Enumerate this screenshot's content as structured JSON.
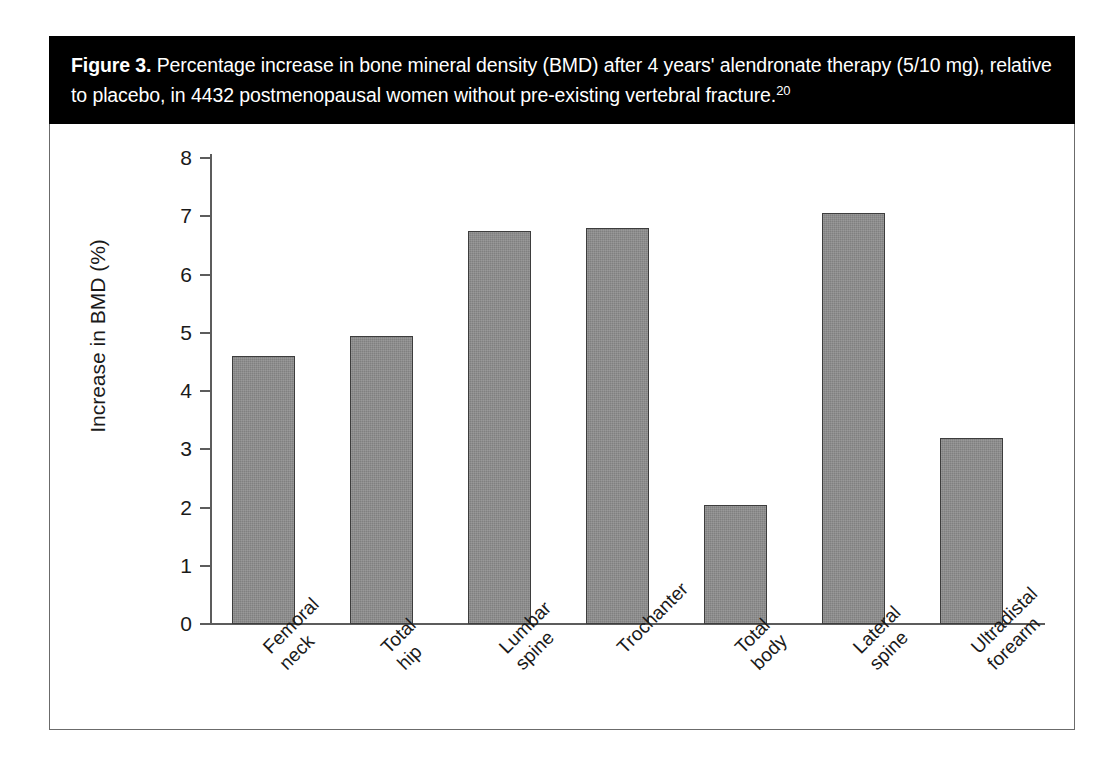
{
  "figure": {
    "label": "Figure 3.",
    "caption": " Percentage increase in bone mineral density (BMD) after 4 years' alendronate therapy (5/10 mg), relative to placebo, in 4432 postmenopausal women without pre-existing vertebral fracture.",
    "reference": "20"
  },
  "chart_data": {
    "type": "bar",
    "title": "Percentage increase in bone mineral density (BMD) after 4 years' alendronate therapy (5/10 mg), relative to placebo, in 4432 postmenopausal women without pre-existing vertebral fracture.",
    "xlabel": "",
    "ylabel": "Increase in BMD (%)",
    "ylim": [
      0,
      8
    ],
    "yticks": [
      0,
      1,
      2,
      3,
      4,
      5,
      6,
      7,
      8
    ],
    "ytick_labels": [
      "0",
      "1",
      "2",
      "3",
      "4",
      "5",
      "6",
      "7",
      "8"
    ],
    "grid": false,
    "legend": false,
    "categories": [
      "Femoral\nneck",
      "Total\nhip",
      "Lumbar\nspine",
      "Trochanter",
      "Total\nbody",
      "Lateral\nspine",
      "Ultradistal\nforearm"
    ],
    "category_labels_flat": [
      "Femoral neck",
      "Total hip",
      "Lumbar spine",
      "Trochanter",
      "Total body",
      "Lateral spine",
      "Ultradistal forearm"
    ],
    "values": [
      4.6,
      4.95,
      6.75,
      6.8,
      2.04,
      7.05,
      3.2
    ],
    "bar_color": "#808080",
    "bar_edge_color": "#3d3d3d",
    "axis_color": "#5c5c5c",
    "background_color": "#ffffff",
    "caption_background_color": "#000000",
    "caption_text_color": "#ffffff"
  }
}
